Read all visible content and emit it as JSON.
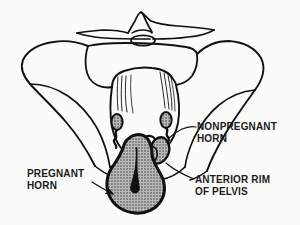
{
  "figure": {
    "type": "anatomical-line-drawing",
    "background_color": "#fbfbf9",
    "ink_color": "#111111",
    "shading_color": "#9a9a9a"
  },
  "labels": {
    "nonpregnant_horn": "NONPREGNANT\nHORN",
    "pregnant_horn": "PREGNANT\nHORN",
    "anterior_rim_of_pelvis": "ANTERIOR RIM\nOF PELVIS"
  },
  "structures": [
    {
      "name": "sacral-promontory",
      "shaded": false
    },
    {
      "name": "left-iliac-wing",
      "shaded": false
    },
    {
      "name": "right-iliac-wing",
      "shaded": false
    },
    {
      "name": "sacrum",
      "shaded": false
    },
    {
      "name": "broad-ligament",
      "shaded": false
    },
    {
      "name": "left-ovary",
      "shaded": true
    },
    {
      "name": "right-ovary",
      "shaded": true
    },
    {
      "name": "pregnant-horn",
      "shaded": true
    },
    {
      "name": "nonpregnant-horn",
      "shaded": true
    },
    {
      "name": "uterine-cavity",
      "shaded": false
    },
    {
      "name": "anterior-rim-of-pelvis",
      "shaded": false
    }
  ]
}
